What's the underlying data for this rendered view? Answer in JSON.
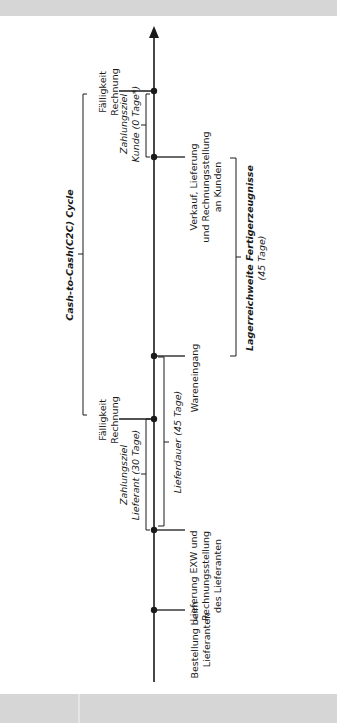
{
  "diagram": {
    "title": "Cash-to-Cash(C2C) Cycle",
    "colors": {
      "line": "#1a1a1a",
      "bar": "#d6d6d6",
      "background": "#ffffff"
    },
    "timeline_events": [
      {
        "id": "bestellung",
        "lines": [
          "Bestellung beim",
          "Lieferanten"
        ]
      },
      {
        "id": "lieferung",
        "lines": [
          "Lieferung EXW und",
          "Rechnungsstellung",
          "des Lieferanten"
        ]
      },
      {
        "id": "faelligkeit_lieferant",
        "lines": [
          "Fälligkeit",
          "Rechnung"
        ]
      },
      {
        "id": "wareneingang",
        "lines": [
          "Wareneingang"
        ]
      },
      {
        "id": "verkauf",
        "lines": [
          "Verkauf, Lieferung",
          "und Rechnungsstellung",
          "an Kunden"
        ]
      },
      {
        "id": "faelligkeit_kunde",
        "lines": [
          "Fälligkeit",
          "Rechnung"
        ]
      }
    ],
    "spans": [
      {
        "id": "zahlungsziel_lieferant",
        "lines": [
          "Zahlungsziel",
          "Lieferant (30 Tage)"
        ]
      },
      {
        "id": "lieferdauer",
        "lines": [
          "Lieferdauer (45 Tage)"
        ]
      },
      {
        "id": "zahlungsziel_kunde",
        "lines": [
          "Zahlungsziel",
          "Kunde (0 Tage*)"
        ]
      },
      {
        "id": "lagerreichweite",
        "lines": [
          "Lagerreichweite Fertigerzeugnisse",
          "(45 Tage)"
        ]
      },
      {
        "id": "c2c",
        "lines": [
          "Cash-to-Cash(C2C) Cycle"
        ]
      }
    ]
  }
}
